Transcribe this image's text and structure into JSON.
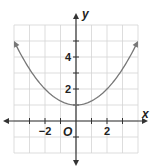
{
  "chart_data": {
    "type": "line",
    "title": "",
    "xlabel": "x",
    "ylabel": "y",
    "origin_label": "O",
    "xlim": [
      -4,
      4
    ],
    "ylim": [
      -2,
      6
    ],
    "grid": true,
    "x_tick_labels": [
      {
        "value": -2,
        "label": "−2"
      },
      {
        "value": 2,
        "label": "2"
      }
    ],
    "y_tick_labels": [
      {
        "value": 2,
        "label": "2"
      },
      {
        "value": 4,
        "label": "4"
      }
    ],
    "series": [
      {
        "name": "parabola",
        "equation": "y = x^2/4 + 1",
        "x": [
          -4,
          -3,
          -2,
          -1,
          0,
          1,
          2,
          3,
          4
        ],
        "y": [
          5,
          3.25,
          2,
          1.25,
          1,
          1.25,
          2,
          3.25,
          5
        ],
        "arrows_at_ends": true,
        "color": "#777777"
      }
    ]
  }
}
